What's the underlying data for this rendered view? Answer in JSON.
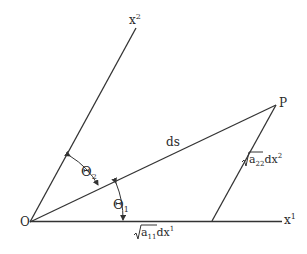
{
  "diagram": {
    "points": {
      "origin": {
        "label": "O",
        "x": 30,
        "y": 222
      },
      "P": {
        "label": "P",
        "x": 276,
        "y": 105
      },
      "foot": {
        "x": 212,
        "y": 221
      }
    },
    "axes": {
      "x1": {
        "label_base": "x",
        "label_sup": "1",
        "end_x": 282,
        "end_y": 221
      },
      "x2": {
        "label_base": "x",
        "label_sup": "2",
        "end_x": 136,
        "end_y": 28
      }
    },
    "segments": {
      "ds": {
        "label": "ds"
      },
      "side_a22": {
        "sqrt_arg": "a",
        "sqrt_sub": "22",
        "suffix": "dx",
        "sup": "2"
      },
      "base_a11": {
        "sqrt_arg": "a",
        "sqrt_sub": "11",
        "suffix": "dx",
        "sup": "1"
      }
    },
    "angles": {
      "theta1": {
        "base": "Θ",
        "sub": "1"
      },
      "theta2": {
        "base": "Θ",
        "sub": "2"
      }
    },
    "stroke_color": "#333333"
  }
}
